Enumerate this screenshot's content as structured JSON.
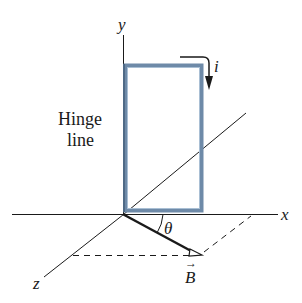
{
  "figure": {
    "type": "physics-diagram",
    "axes": {
      "x_label": "x",
      "y_label": "y",
      "z_label": "z"
    },
    "labels": {
      "hinge_line_1": "Hinge",
      "hinge_line_2": "line",
      "current": "i",
      "angle": "θ",
      "field": "B",
      "field_arrow": "→"
    },
    "colors": {
      "loop_outer": "#6e8aa8",
      "loop_inner": "#a9bfd4",
      "lines": "#1a1a1a",
      "background": "#ffffff"
    }
  }
}
